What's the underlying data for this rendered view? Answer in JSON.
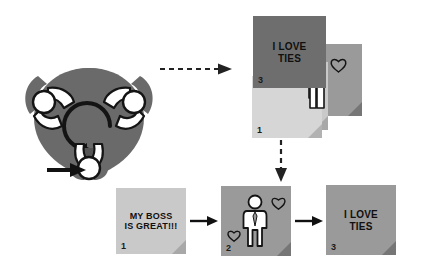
{
  "diagram": {
    "colors": {
      "card_dark": "#6e6e6e",
      "card_mid": "#9a9a9a",
      "card_light": "#c9c9c9",
      "card_pale": "#d6d6d6",
      "hub_circle": "#5a5a5a",
      "person_body": "#6e6e6e",
      "person_fill": "#ffffff",
      "ink": "#111111",
      "background": "#ffffff"
    }
  },
  "group": {
    "name": "rotating-group",
    "hub_arrow": "counter-clockwise-rotation-arrow",
    "entry_arrow": "solid-black-arrow",
    "participants": [
      {
        "id": "participant-left",
        "label": ""
      },
      {
        "id": "participant-right",
        "label": ""
      },
      {
        "id": "participant-bottom",
        "label": ""
      }
    ]
  },
  "connectors": {
    "group_to_stack": {
      "name": "dashed-arrow-right",
      "style": "dashed"
    },
    "stack_to_sequence": {
      "name": "dashed-arrow-down",
      "style": "dashed"
    },
    "seq_1_to_2": {
      "name": "solid-arrow-right",
      "style": "solid"
    },
    "seq_2_to_3": {
      "name": "solid-arrow-right",
      "style": "solid"
    }
  },
  "stack": {
    "name": "card-stack",
    "cards": [
      {
        "number": "1",
        "shade": "pale",
        "text": "",
        "icons": []
      },
      {
        "number": "2",
        "shade": "light",
        "text": "C\nO",
        "icons": [
          "heart-small",
          "hand-outline"
        ]
      },
      {
        "number": "3",
        "shade": "dark",
        "text": "I LOVE\nTIES",
        "icons": []
      },
      {
        "number": "",
        "shade": "mid",
        "text": "",
        "icons": [
          "heart-outline"
        ]
      }
    ]
  },
  "sequence": {
    "name": "card-sequence",
    "cards": [
      {
        "number": "1",
        "shade": "light",
        "text": "MY BOSS\nIS GREAT!!!",
        "icons": []
      },
      {
        "number": "2",
        "shade": "mid",
        "text": "",
        "icons": [
          "person-with-tie",
          "heart-outline",
          "heart-outline"
        ]
      },
      {
        "number": "3",
        "shade": "mid",
        "text": "I LOVE\nTIES",
        "icons": []
      }
    ]
  }
}
